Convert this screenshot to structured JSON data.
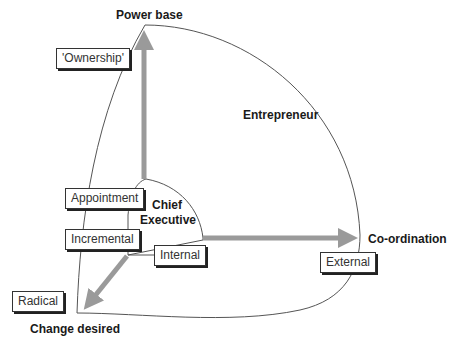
{
  "diagram": {
    "axes": {
      "vertical": "Power base",
      "horizontal": "Co-ordination",
      "diagonal": "Change desired"
    },
    "regions": {
      "outer": "Entrepreneur",
      "inner_line1": "Chief",
      "inner_line2": "Executive"
    },
    "boxes": {
      "ownership": "'Ownership'",
      "appointment": "Appointment",
      "incremental": "Incremental",
      "internal": "Internal",
      "external": "External",
      "radical": "Radical"
    },
    "colors": {
      "arrow": "#9a9a9a",
      "outline": "#555555",
      "text": "#1a1a1a"
    }
  }
}
